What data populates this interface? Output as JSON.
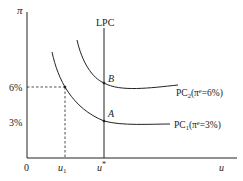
{
  "diagram": {
    "type": "phillips-curve",
    "y_axis_label": "π",
    "x_axis_label": "u",
    "origin_label": "0",
    "y_ticks": [
      {
        "label": "6%",
        "value": 6
      },
      {
        "label": "3%",
        "value": 3
      }
    ],
    "x_ticks": [
      {
        "label": "u",
        "sub": "1"
      },
      {
        "label": "u",
        "sup": "*"
      }
    ],
    "lpc_label": "LPC",
    "points": {
      "A": "A",
      "B": "B"
    },
    "curves": [
      {
        "name": "PC",
        "sub": "2",
        "expectation": "(π",
        "exp_sup": "e",
        "exp_value": "=6%)"
      },
      {
        "name": "PC",
        "sub": "1",
        "expectation": "(π",
        "exp_sup": "e",
        "exp_value": "=3%)"
      }
    ]
  }
}
